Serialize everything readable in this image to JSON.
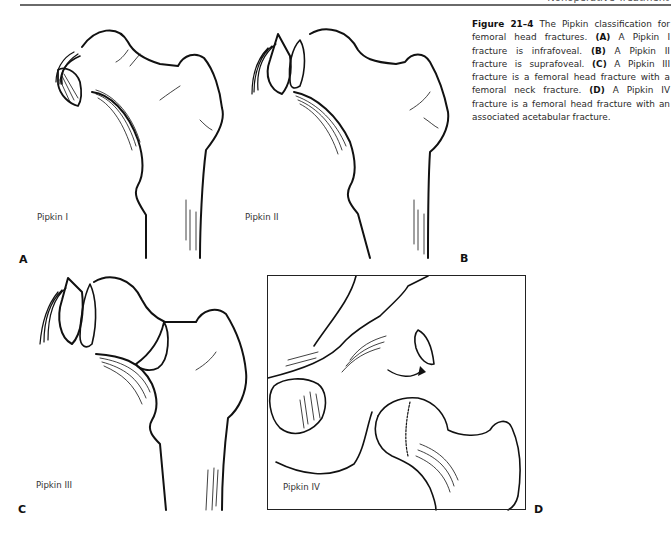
{
  "running_header": {
    "text": "Nonoperative Treatment"
  },
  "figure": {
    "number": "Figure 21–4",
    "caption_intro": " The Pipkin classification for femoral head fractures. ",
    "parts": [
      {
        "tag": "(A)",
        "text": " A Pipkin I fracture is infrafoveal. "
      },
      {
        "tag": "(B)",
        "text": " A Pipkin II fracture is suprafoveal. "
      },
      {
        "tag": "(C)",
        "text": " A Pipkin III fracture is a femoral head fracture with a femoral neck fracture. "
      },
      {
        "tag": "(D)",
        "text": " A Pipkin IV fracture is a femoral head fracture with an associated acetabular fracture."
      }
    ]
  },
  "panels": {
    "a": {
      "letter": "A",
      "label": "Pipkin I"
    },
    "b": {
      "letter": "B",
      "label": "Pipkin II"
    },
    "c": {
      "letter": "C",
      "label": "Pipkin III"
    },
    "d": {
      "letter": "D",
      "label": "Pipkin IV"
    }
  }
}
